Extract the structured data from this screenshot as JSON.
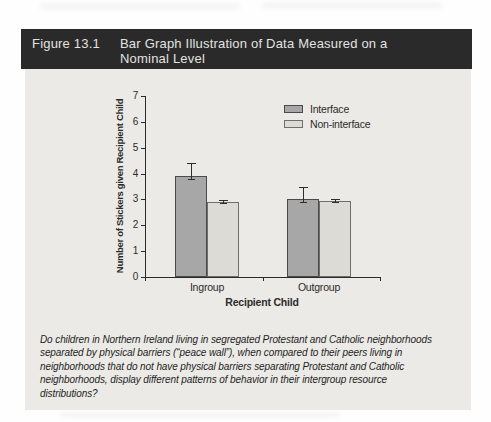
{
  "figure": {
    "label": "Figure 13.1",
    "title_line1": "Bar Graph Illustration of Data Measured on a",
    "title_line2": "Nominal Level"
  },
  "chart_data": {
    "type": "bar",
    "title": "",
    "categories": [
      "Ingroup",
      "Outgroup"
    ],
    "series": [
      {
        "name": "Interface",
        "values": [
          3.9,
          3.0
        ],
        "errors": [
          0.5,
          0.5
        ],
        "color": "#a7a7a7",
        "border": "#4a4a4a"
      },
      {
        "name": "Non-interface",
        "values": [
          2.9,
          2.95
        ],
        "errors": [
          0.07,
          0.07
        ],
        "color": "#dcdbd6",
        "border": "#6e6e6e"
      }
    ],
    "xlabel": "Recipient Child",
    "ylabel": "Number of Stickers given Recipient Child",
    "ylim": [
      0,
      7
    ],
    "yticks": [
      0,
      1,
      2,
      3,
      4,
      5,
      6,
      7
    ],
    "grid": false,
    "legend_position": "top-right",
    "error_bars": true
  },
  "caption": {
    "lines": [
      "Do children in Northern Ireland living in segregated Protestant and Catholic neighborhoods",
      "separated by physical barriers (“peace wall”), when compared to their peers living in",
      "neighborhoods that do not have physical barriers separating Protestant and Catholic",
      "neighborhoods, display different patterns of behavior in their intergroup resource",
      "distributions?"
    ]
  },
  "colors": {
    "titlebar_bg": "#2a2a2a",
    "titlebar_text": "#e3e3e1",
    "panel_bg": "#ebeae6",
    "axis": "#2b2b2b"
  }
}
